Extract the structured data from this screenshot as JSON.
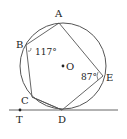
{
  "diagram": {
    "type": "circle-geometry",
    "circle": {
      "center_label": "O",
      "cx": 63,
      "cy": 66,
      "r": 43
    },
    "points": [
      {
        "id": "A",
        "label": "A",
        "x": 59,
        "y": 23,
        "lx": 55,
        "ly": 17
      },
      {
        "id": "B",
        "label": "B",
        "x": 26,
        "y": 45,
        "lx": 16,
        "ly": 48
      },
      {
        "id": "C",
        "label": "C",
        "x": 32,
        "y": 97,
        "lx": 21,
        "ly": 104
      },
      {
        "id": "D",
        "label": "D",
        "x": 62,
        "y": 110,
        "lx": 58,
        "ly": 123
      },
      {
        "id": "E",
        "label": "E",
        "x": 103,
        "y": 76,
        "lx": 106,
        "ly": 81
      },
      {
        "id": "T",
        "label": "T",
        "x": 20,
        "y": 110,
        "lx": 16,
        "ly": 123
      }
    ],
    "angles": [
      {
        "at": "B",
        "value": "117°",
        "x": 35,
        "y": 53
      },
      {
        "at": "E",
        "value": "87°",
        "x": 81,
        "y": 80
      }
    ],
    "center_label": "O",
    "tangent_line": {
      "x1": 9,
      "y1": 110,
      "x2": 118,
      "y2": 110,
      "label": "T"
    },
    "colors": {
      "stroke": "#555555",
      "text": "#222222",
      "background": "#ffffff"
    }
  }
}
